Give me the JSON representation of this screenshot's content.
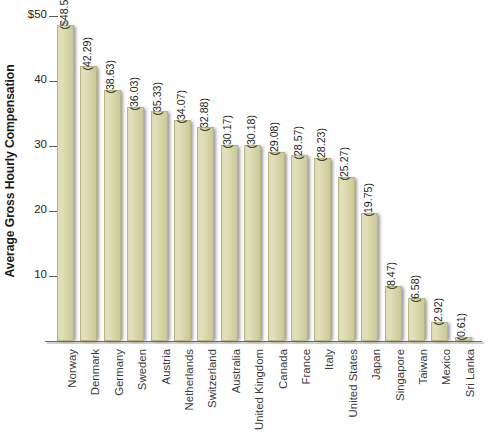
{
  "chart_data": {
    "type": "bar",
    "title": "",
    "xlabel": "",
    "ylabel": "Average Gross Hourly Compensation",
    "ylim": [
      0,
      50
    ],
    "grid": false,
    "legend": "none",
    "orientation": "vertical",
    "axis_tick_labels": [
      "$50",
      "40",
      "30",
      "20",
      "10"
    ],
    "axis_tick_values": [
      50,
      40,
      30,
      20,
      10
    ],
    "categories": [
      "Norway",
      "Denmark",
      "Germany",
      "Sweden",
      "Austria",
      "Netherlands",
      "Switzerland",
      "Australia",
      "United Kingdom",
      "Canada",
      "France",
      "Italy",
      "United States",
      "Japan",
      "Singapore",
      "Taiwan",
      "Mexico",
      "Sri Lanka"
    ],
    "values": [
      48.56,
      42.29,
      38.63,
      36.03,
      35.33,
      34.07,
      32.88,
      30.17,
      30.18,
      29.08,
      28.57,
      28.23,
      25.27,
      19.75,
      8.47,
      6.58,
      2.92,
      0.61
    ],
    "data_labels": [
      "($48.56)",
      "(42.29)",
      "(38.63)",
      "(36.03)",
      "(35.33)",
      "(34.07)",
      "(32.88)",
      "(30.17)",
      "(30.18)",
      "(29.08)",
      "(28.57)",
      "(28.23)",
      "(25.27)",
      "(19.75)",
      "(8.47)",
      "(6.58)",
      "(2.92)",
      "(0.61)"
    ],
    "colors": {
      "bar_fill": "#dcdab4",
      "bar_edge": "#b9b684",
      "axis": "#6b6b6b",
      "text": "#231f20",
      "category_text": "#3a3a3a",
      "background": "#ffffff"
    }
  },
  "footer": {
    "text": ""
  }
}
